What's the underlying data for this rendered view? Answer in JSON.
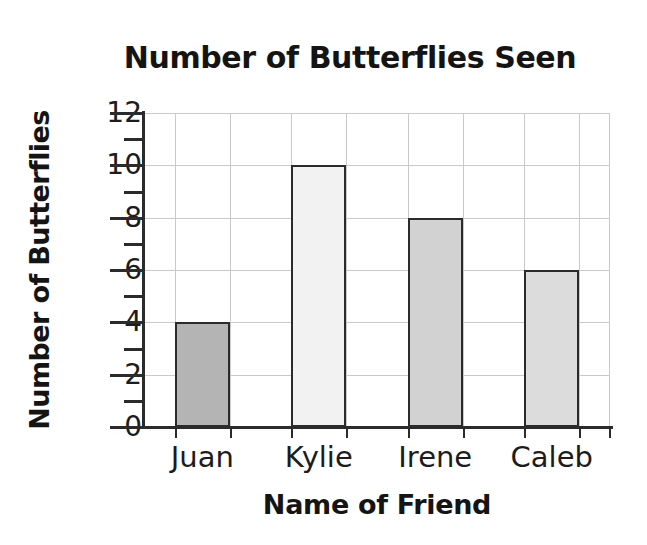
{
  "top_remnant": {
    "text": "·· ··   ·· ···     ···· ·· ·"
  },
  "chart_data": {
    "type": "bar",
    "title": "Number of Butterflies Seen",
    "xlabel": "Name of Friend",
    "ylabel": "Number of Butterflies",
    "categories": [
      "Juan",
      "Kylie",
      "Irene",
      "Caleb"
    ],
    "values": [
      4,
      10,
      8,
      6
    ],
    "ylim": [
      0,
      12
    ],
    "ytick_labels": [
      "0",
      "2",
      "4",
      "6",
      "8",
      "10",
      "12"
    ],
    "ytick_values": [
      0,
      2,
      4,
      6,
      8,
      10,
      12
    ],
    "yminor_tick_values": [
      1,
      3,
      5,
      7,
      9,
      11
    ],
    "grid": true,
    "grid_axis": "both",
    "legend": false,
    "bar_colors": [
      "#b4b4b4",
      "#f2f2f2",
      "#d2d2d2",
      "#dcdcdc"
    ],
    "bar_edge_color": "#2b2b2b",
    "grid_color": "#c9c9c9",
    "axis_color": "#2b2b2b",
    "background_color": "#ffffff"
  }
}
